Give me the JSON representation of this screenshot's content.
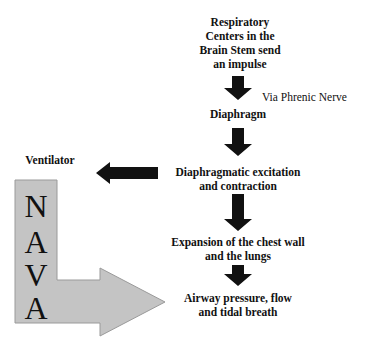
{
  "diagram": {
    "colors": {
      "arrow": "#111111",
      "nava_fill": "#c4c4c4",
      "nava_stroke": "#9a9a9a",
      "text": "#111111"
    },
    "nodes": [
      {
        "id": "respiratory_centers",
        "lines": [
          "Respiratory",
          "Centers in the",
          "Brain Stem send",
          "an impulse"
        ]
      },
      {
        "id": "diaphragm",
        "lines": [
          "Diaphragm"
        ]
      },
      {
        "id": "excitation",
        "lines": [
          "Diaphragmatic excitation",
          "and contraction"
        ]
      },
      {
        "id": "expansion",
        "lines": [
          "Expansion of the chest wall",
          "and the lungs"
        ]
      },
      {
        "id": "airway",
        "lines": [
          "Airway pressure, flow",
          "and tidal breath"
        ]
      }
    ],
    "edge_labels": {
      "phrenic": "Via Phrenic Nerve"
    },
    "ventilator_label": "Ventilator",
    "nava_letters": [
      "N",
      "A",
      "V",
      "A"
    ]
  }
}
